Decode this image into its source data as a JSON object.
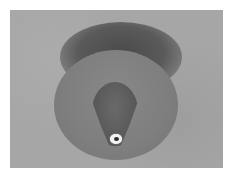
{
  "image": {
    "description": "Grayscale photo of a ceiling-mounted round fixture with a conical nozzle and white-ringed tip",
    "colors": {
      "background": "#a6a6a6",
      "fixture_base": "#7e7e7e",
      "shadow": "#4a4a4a",
      "cone": "#5c5c5c",
      "nozzle_ring": "#f2f2f2",
      "nozzle_hole": "#2a2a2a",
      "border": "#ffffff"
    }
  }
}
